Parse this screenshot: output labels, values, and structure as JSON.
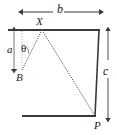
{
  "figure": {
    "labels": {
      "width_b": "b",
      "height_a": "a",
      "height_c": "c",
      "angle_theta": "θ",
      "point_X": "X",
      "point_B": "B",
      "point_P": "P"
    },
    "colors": {
      "line": "#3a3a3a",
      "ray": "#555555",
      "text": "#1a1a1a",
      "background": "#ffffff"
    },
    "geometry": {
      "top_line": {
        "x1": 8,
        "y1": 30,
        "x2": 100,
        "y2": 30
      },
      "bottom_line": {
        "x1": 22,
        "y1": 116,
        "x2": 96,
        "y2": 116
      },
      "right_line": {
        "x1": 99,
        "y1": 30,
        "x2": 95,
        "y2": 116
      },
      "point_X": {
        "x": 42,
        "y": 30
      },
      "point_B": {
        "x": 22,
        "y": 70
      },
      "point_P": {
        "x": 95,
        "y": 116
      },
      "dim_b": {
        "x1": 22,
        "x2": 100,
        "y": 12
      },
      "dim_a": {
        "x": 14,
        "y1": 30,
        "y2": 70
      },
      "dim_c": {
        "x": 108,
        "y1": 30,
        "y2": 116
      }
    }
  }
}
